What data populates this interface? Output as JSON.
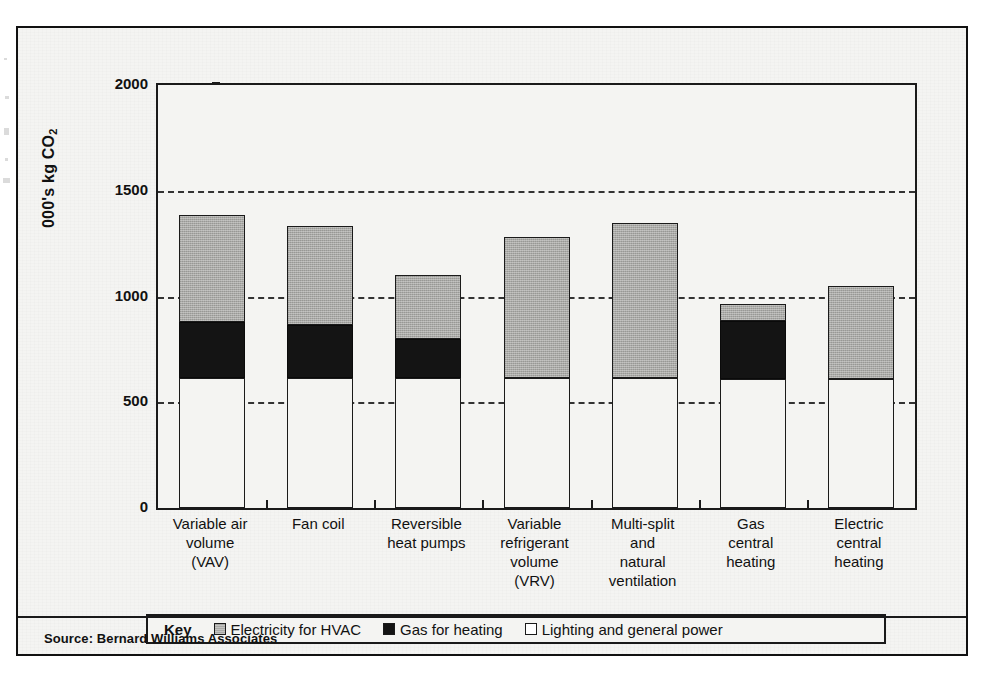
{
  "figure": {
    "y_axis_title": "000's kg CO",
    "y_axis_title_sub": "2",
    "source": "Source: Bernard Williams Associates"
  },
  "legend": {
    "title": "Key",
    "entries": [
      {
        "label": "Electricity for HVAC",
        "swatch": "elec",
        "color": "#a9a9a6"
      },
      {
        "label": "Gas for heating",
        "swatch": "gas",
        "color": "#141414"
      },
      {
        "label": "Lighting and general power",
        "swatch": "lighting",
        "color": "#ffffff"
      }
    ]
  },
  "chart_data": {
    "type": "bar",
    "stacked": true,
    "title": "",
    "xlabel": "",
    "ylabel": "000's kg CO2",
    "ylim": [
      0,
      2000
    ],
    "yticks": [
      0,
      500,
      1000,
      1500,
      2000
    ],
    "ytick_labels": [
      "0",
      "500",
      "1000",
      "1500",
      "2000"
    ],
    "grid": "horizontal-dashed",
    "legend_position": "bottom",
    "categories": [
      "Variable air\nvolume\n(VAV)",
      "Fan coil",
      "Reversible\nheat pumps",
      "Variable\nrefrigerant\nvolume\n(VRV)",
      "Multi-split\nand\nnatural\nventilation",
      "Gas\ncentral\nheating",
      "Electric\ncentral\nheating"
    ],
    "category_lines": [
      [
        "Variable air",
        "volume",
        "(VAV)"
      ],
      [
        "Fan coil"
      ],
      [
        "Reversible",
        "heat pumps"
      ],
      [
        "Variable",
        "refrigerant",
        "volume",
        "(VRV)"
      ],
      [
        "Multi-split",
        "and",
        "natural",
        "ventilation"
      ],
      [
        "Gas",
        "central",
        "heating"
      ],
      [
        "Electric",
        "central",
        "heating"
      ]
    ],
    "series": [
      {
        "name": "Lighting and general power",
        "color": "#f4f4f2",
        "values": [
          615,
          615,
          615,
          615,
          615,
          610,
          610
        ]
      },
      {
        "name": "Gas for heating",
        "color": "#141414",
        "values": [
          265,
          250,
          185,
          0,
          0,
          275,
          0
        ]
      },
      {
        "name": "Electricity for HVAC",
        "color": "#a9a9a6",
        "values": [
          505,
          470,
          300,
          665,
          735,
          80,
          440
        ]
      }
    ],
    "totals": [
      1385,
      1335,
      1100,
      1280,
      1350,
      965,
      1050
    ]
  }
}
